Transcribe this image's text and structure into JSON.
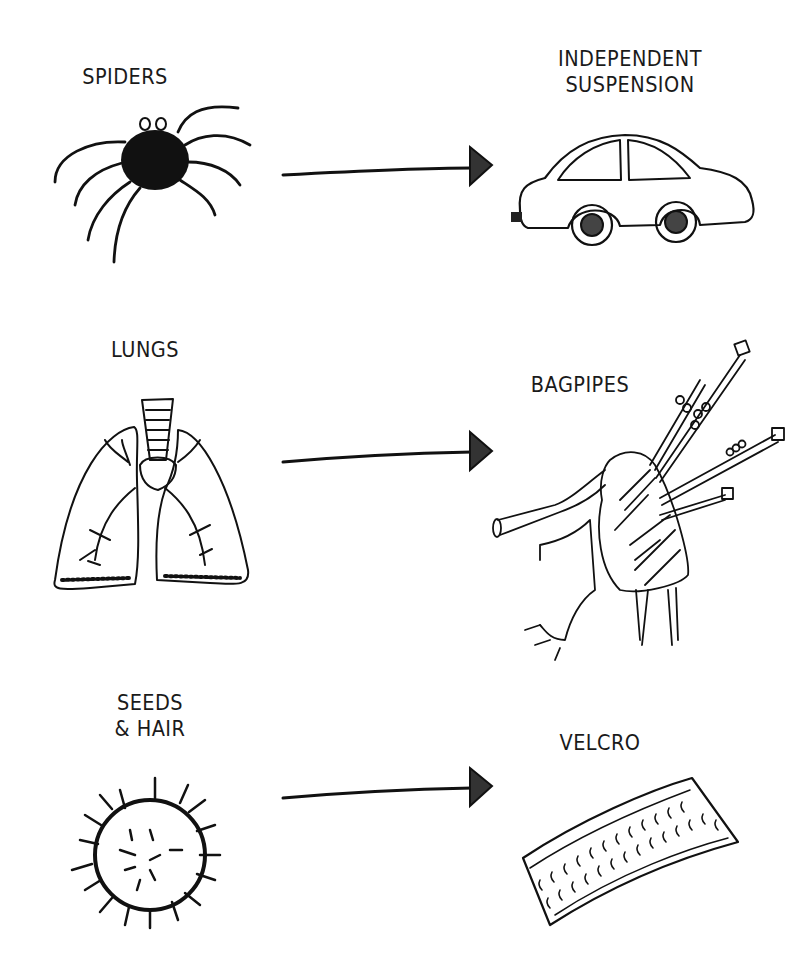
{
  "diagram": {
    "rows": [
      {
        "source": {
          "label": "SPIDERS",
          "icon": "spider-icon"
        },
        "target": {
          "label": "INDEPENDENT\nSUSPENSION",
          "icon": "car-icon"
        }
      },
      {
        "source": {
          "label": "LUNGS",
          "icon": "lungs-icon"
        },
        "target": {
          "label": "BAGPIPES",
          "icon": "bagpipes-icon"
        }
      },
      {
        "source": {
          "label": "SEEDS\n& HAIR",
          "icon": "burr-seed-icon"
        },
        "target": {
          "label": "VELCRO",
          "icon": "velcro-icon"
        }
      }
    ],
    "connector": "arrow-right-icon",
    "ink_color": "#111111",
    "background": "#ffffff"
  }
}
